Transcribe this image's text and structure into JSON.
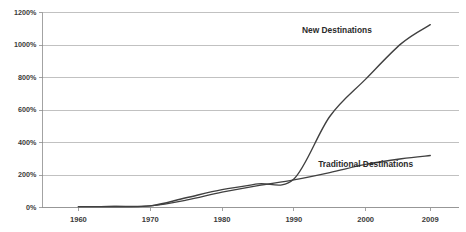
{
  "chart_data": {
    "type": "line",
    "title": "",
    "subtitle": "",
    "xlabel": "",
    "ylabel": "",
    "xlim": [
      1955,
      2013
    ],
    "ylim": [
      0,
      1200
    ],
    "grid": true,
    "grid_axis": "y",
    "legend_position": "inline-annotations",
    "x_tick_labels": [
      "1960",
      "1970",
      "1980",
      "1990",
      "2000",
      "2009"
    ],
    "x_tick_values": [
      1960,
      1970,
      1980,
      1990,
      2000,
      2009
    ],
    "y_tick_labels": [
      "0%",
      "200%",
      "400%",
      "600%",
      "800%",
      "1000%",
      "1200%"
    ],
    "y_tick_values": [
      0,
      200,
      400,
      600,
      800,
      1000,
      1200
    ],
    "y_unit": "%",
    "series": [
      {
        "name": "New Destinations",
        "color": "#404040",
        "label_x": 1996,
        "label_y": 1075,
        "x": [
          1960,
          1965,
          1970,
          1975,
          1980,
          1985,
          1990,
          1995,
          2000,
          2005,
          2009
        ],
        "values": [
          5,
          6,
          10,
          60,
          110,
          145,
          175,
          560,
          790,
          1010,
          1125
        ]
      },
      {
        "name": "Traditional Destinations",
        "color": "#404040",
        "label_x": 2000,
        "label_y": 250,
        "x": [
          1960,
          1965,
          1970,
          1975,
          1980,
          1985,
          1990,
          1995,
          2000,
          2005,
          2009
        ],
        "values": [
          5,
          6,
          10,
          45,
          95,
          135,
          170,
          215,
          265,
          300,
          320
        ]
      }
    ],
    "annotations": [
      {
        "text": "New Destinations",
        "x": 1996,
        "y": 1075
      },
      {
        "text": "Traditional Destinations",
        "x": 2000,
        "y": 250
      }
    ]
  },
  "colors": {
    "background": "#ffffff",
    "gridline": "#a6a6a6",
    "axis": "#8c8c8c",
    "text": "#3a3a3a",
    "series": "#404040"
  }
}
